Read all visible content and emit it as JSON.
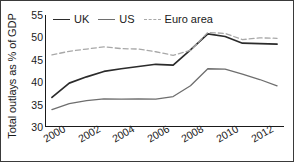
{
  "chart_data": {
    "type": "line",
    "title": "",
    "xlabel": "",
    "ylabel": "Total outlays as % of GDP",
    "xlim": [
      1999.6,
      2013.4
    ],
    "ylim": [
      30,
      55
    ],
    "grid": false,
    "legend_position": "top-left",
    "x": [
      2000,
      2001,
      2002,
      2003,
      2004,
      2005,
      2006,
      2007,
      2008,
      2009,
      2010,
      2011,
      2012,
      2013
    ],
    "xticklabels": [
      "2000",
      "2002",
      "2004",
      "2006",
      "2008",
      "2010",
      "2012"
    ],
    "xtickvalues": [
      2000,
      2002,
      2004,
      2006,
      2008,
      2010,
      2012
    ],
    "yticklabels": [
      "30",
      "35",
      "40",
      "45",
      "50",
      "55"
    ],
    "ytickvalues": [
      30,
      35,
      40,
      45,
      50,
      55
    ],
    "series": [
      {
        "name": "UK",
        "style": "solid",
        "color": "#2b2b2b",
        "values": [
          36.6,
          39.8,
          41.2,
          42.4,
          43.0,
          43.5,
          44.0,
          43.8,
          47.2,
          50.8,
          50.2,
          48.7,
          48.6,
          48.5
        ]
      },
      {
        "name": "US",
        "style": "solid",
        "color": "#6e6e6e",
        "values": [
          33.9,
          35.2,
          35.9,
          36.3,
          36.2,
          36.3,
          36.2,
          36.8,
          39.2,
          43.0,
          42.9,
          41.8,
          40.6,
          39.2
        ]
      },
      {
        "name": "Euro area",
        "style": "dashed",
        "color": "#a8a8a8",
        "values": [
          46.1,
          46.9,
          47.4,
          47.9,
          47.5,
          47.4,
          46.8,
          46.0,
          47.1,
          51.1,
          50.9,
          49.5,
          49.9,
          49.8
        ]
      }
    ]
  },
  "legend": {
    "items": [
      {
        "label": "UK"
      },
      {
        "label": "US"
      },
      {
        "label": "Euro area"
      }
    ]
  },
  "axes": {
    "y_title": "Total outlays as % of GDP"
  }
}
